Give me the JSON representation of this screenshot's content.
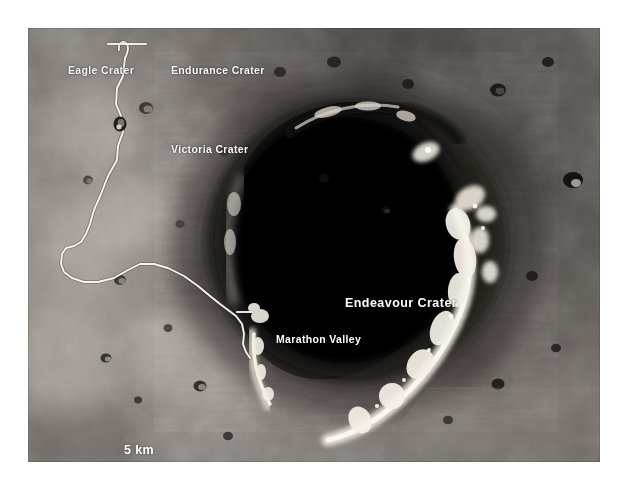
{
  "figure": {
    "kind": "annotated-orbital-map",
    "background_color": "#ffffff",
    "label_color": "#ffffff",
    "traverse_color": "#f2f0ea"
  },
  "labels": {
    "eagle_crater": "Eagle Crater",
    "endurance_crater": "Endurance Crater",
    "victoria_crater": "Victoria Crater",
    "marathon_valley": "Marathon Valley",
    "endeavour_crater": "Endeavour Crater"
  },
  "scalebar": {
    "text": "5 km",
    "length_px": 102
  }
}
